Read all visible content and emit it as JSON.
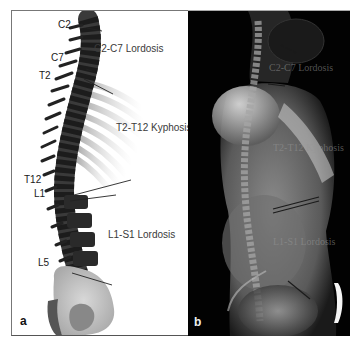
{
  "figure": {
    "panel_a": {
      "letter": "a",
      "vertebra_labels": {
        "c2": "C2",
        "c7": "C7",
        "t2": "T2",
        "t12": "T12",
        "l1": "L1",
        "l5": "L5"
      },
      "region_labels": {
        "cervical": "C2-C7 Lordosis",
        "thoracic": "T2-T12 Kyphosis",
        "lumbar": "L1-S1 Lordosis"
      }
    },
    "panel_b": {
      "letter": "b",
      "region_labels": {
        "cervical": "C2-C7 Lordosis",
        "thoracic": "T2-T12 Kyphosis",
        "lumbar": "L1-S1 Lordosis"
      }
    },
    "colors": {
      "border": "#777777",
      "xray_background": "#020202",
      "label_text": "#1a1a1a"
    }
  }
}
